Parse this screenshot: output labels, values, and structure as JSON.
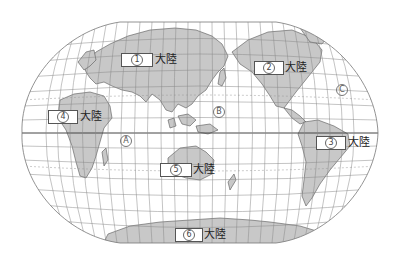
{
  "map": {
    "projection": "Winkel tripel style world map",
    "colors": {
      "land": "#c8c8c8",
      "ocean": "#ffffff",
      "grid": "#888888",
      "coast": "#555555",
      "equator": "#444444"
    },
    "continent_suffix": "大陸",
    "continents": [
      {
        "id": "1",
        "number": "①",
        "suffix": "大陸",
        "box": {
          "x": 121,
          "y": 53,
          "w": 32
        },
        "suffix_x": 155,
        "suffix_y": 53
      },
      {
        "id": "2",
        "number": "②",
        "suffix": "大陸",
        "box": {
          "x": 254,
          "y": 61,
          "w": 30
        },
        "suffix_x": 285,
        "suffix_y": 61
      },
      {
        "id": "3",
        "number": "③",
        "suffix": "大陸",
        "box": {
          "x": 316,
          "y": 136,
          "w": 30
        },
        "suffix_x": 348,
        "suffix_y": 136
      },
      {
        "id": "4",
        "number": "④",
        "suffix": "大陸",
        "box": {
          "x": 48,
          "y": 110,
          "w": 30
        },
        "suffix_x": 80,
        "suffix_y": 110
      },
      {
        "id": "5",
        "number": "⑤",
        "suffix": "大陸",
        "box": {
          "x": 160,
          "y": 163,
          "w": 32
        },
        "suffix_x": 193,
        "suffix_y": 163
      },
      {
        "id": "6",
        "number": "⑥",
        "suffix": "大陸",
        "box": {
          "x": 175,
          "y": 228,
          "w": 28
        },
        "suffix_x": 204,
        "suffix_y": 228
      }
    ],
    "oceans": [
      {
        "id": "A",
        "mark": "Ⓐ",
        "x": 120,
        "y": 135
      },
      {
        "id": "B",
        "mark": "Ⓑ",
        "x": 213,
        "y": 106
      },
      {
        "id": "C",
        "mark": "Ⓒ",
        "x": 336,
        "y": 84
      }
    ]
  }
}
